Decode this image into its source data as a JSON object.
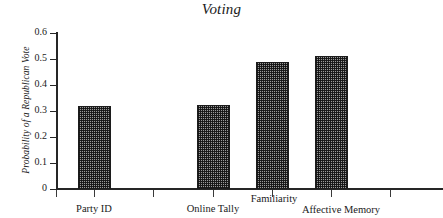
{
  "chart_data": {
    "type": "bar",
    "title": "Voting",
    "xlabel": "",
    "ylabel": "Probability of a Republican Vote",
    "categories": [
      "Party ID",
      "Online Tally",
      "Familiarity",
      "Affective Memory"
    ],
    "values": [
      0.32,
      0.325,
      0.49,
      0.51
    ],
    "ylim": [
      0,
      0.6
    ],
    "ytick_labels": [
      "0",
      "0.1",
      "0.2",
      "0.3",
      "0.4",
      "0.5",
      "0.6"
    ],
    "ytick_values": [
      0,
      0.1,
      0.2,
      0.3,
      0.4,
      0.5,
      0.6
    ],
    "grid": false,
    "legend": null,
    "bar_fill": "#9a9a9a",
    "bar_edge": "#1c1c1c",
    "axis_color": "#262626",
    "background": "#ffffff"
  },
  "figure": {
    "title": "Voting",
    "y_axis_title": "Probability of a Republican Vote"
  }
}
